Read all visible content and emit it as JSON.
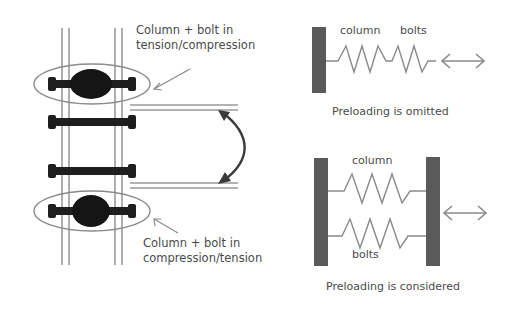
{
  "left_panel": {
    "top_callout": {
      "line1": "Column + bolt in",
      "line2": "tension/compression"
    },
    "bottom_callout": {
      "line1": "Column + bolt in",
      "line2": "compression/tension"
    }
  },
  "right_panel": {
    "top_model": {
      "column_label": "column",
      "bolts_label": "bolts",
      "caption": "Preloading is omitted"
    },
    "bottom_model": {
      "column_label": "column",
      "bolts_label": "bolts",
      "caption": "Preloading is considered"
    }
  },
  "colors": {
    "dark": "#1e1e1e",
    "gray": "#8a8a8a",
    "plate": "#5a5a5a",
    "text": "#4a4a4a"
  }
}
